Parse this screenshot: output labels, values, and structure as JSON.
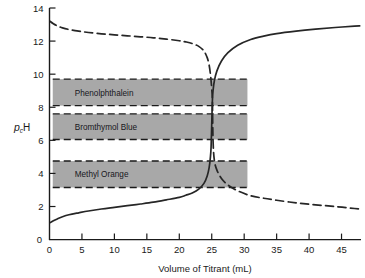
{
  "chart_data": {
    "type": "line",
    "title": "",
    "xlabel": "Volume of Titrant (mL)",
    "ylabel": "pcH",
    "xlim": [
      0,
      48
    ],
    "ylim": [
      0,
      14
    ],
    "grid": false,
    "legend_position": "none",
    "xticks": [
      0,
      5,
      10,
      15,
      20,
      25,
      30,
      35,
      40,
      45
    ],
    "xtick_labels": [
      "0",
      "5",
      "10",
      "15",
      "20",
      "25",
      "30",
      "35",
      "40",
      "45"
    ],
    "yticks": [
      0,
      2,
      4,
      6,
      8,
      10,
      12,
      14
    ],
    "ytick_labels": [
      "0",
      "2",
      "4",
      "6",
      "8",
      "10",
      "12",
      "14"
    ],
    "series": [
      {
        "name": "Acid titrated with base (rising)",
        "style": "solid",
        "color": "#262626",
        "x": [
          0.0,
          0.6,
          1.2,
          2.0,
          3.0,
          4.5,
          6.0,
          8.0,
          10.0,
          12.0,
          14.0,
          16.0,
          18.0,
          20.0,
          21.0,
          22.0,
          23.0,
          23.8,
          24.3,
          24.6,
          24.8,
          24.9,
          25.0,
          25.1,
          25.2,
          25.4,
          25.8,
          26.5,
          27.5,
          29.0,
          31.0,
          33.0,
          35.0,
          38.0,
          41.0,
          44.0,
          47.0,
          47.8
        ],
        "y": [
          1.0,
          1.14,
          1.25,
          1.38,
          1.5,
          1.62,
          1.73,
          1.85,
          1.95,
          2.05,
          2.15,
          2.26,
          2.4,
          2.55,
          2.68,
          2.82,
          3.05,
          3.4,
          3.85,
          4.35,
          5.0,
          5.6,
          7.0,
          8.4,
          9.0,
          9.6,
          10.2,
          10.8,
          11.3,
          11.75,
          12.1,
          12.3,
          12.45,
          12.6,
          12.72,
          12.82,
          12.9,
          12.92
        ]
      },
      {
        "name": "Base titrated with acid (falling)",
        "style": "dashed",
        "color": "#262626",
        "x": [
          0.0,
          0.6,
          1.2,
          2.0,
          3.0,
          4.5,
          6.0,
          8.0,
          10.0,
          12.0,
          14.0,
          16.0,
          18.0,
          20.0,
          21.0,
          22.0,
          23.0,
          23.8,
          24.3,
          24.6,
          24.8,
          24.9,
          25.0,
          25.1,
          25.2,
          25.4,
          25.8,
          26.5,
          27.5,
          29.0,
          31.0,
          33.0,
          35.0,
          38.0,
          41.0,
          44.0,
          47.0,
          47.8
        ],
        "y": [
          13.22,
          13.05,
          12.92,
          12.8,
          12.7,
          12.6,
          12.52,
          12.44,
          12.38,
          12.32,
          12.26,
          12.2,
          12.12,
          12.02,
          11.95,
          11.85,
          11.68,
          11.4,
          11.0,
          10.55,
          10.0,
          9.6,
          9.1,
          8.4,
          6.0,
          4.8,
          4.2,
          3.7,
          3.3,
          2.95,
          2.65,
          2.5,
          2.38,
          2.22,
          2.1,
          2.0,
          1.88,
          1.85
        ]
      }
    ],
    "bands": [
      {
        "label": "Phenolphthalein",
        "ph_low": 8.1,
        "ph_high": 9.7,
        "x_start": 0.5,
        "x_end": 30.5,
        "fill": "#a8a8a8",
        "edge_style": "dashed"
      },
      {
        "label": "Bromthymol Blue",
        "ph_low": 6.05,
        "ph_high": 7.6,
        "x_start": 0.5,
        "x_end": 30.5,
        "fill": "#a8a8a8",
        "edge_style": "dashed"
      },
      {
        "label": "Methyl Orange",
        "ph_low": 3.15,
        "ph_high": 4.75,
        "x_start": 0.5,
        "x_end": 30.5,
        "fill": "#a8a8a8",
        "edge_style": "dashed"
      }
    ],
    "annotations": {
      "equivalence_volume": 25,
      "ylabel_parts": {
        "p": "p",
        "sub": "c",
        "H": "H"
      }
    }
  }
}
